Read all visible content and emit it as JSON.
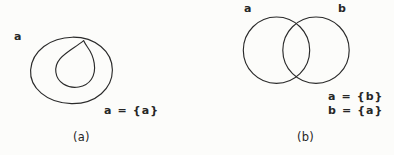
{
  "figure": {
    "background_color": "#fcfcfa",
    "ink_color": "#2a2a2a",
    "panels": [
      {
        "id": "a",
        "caption": "(a)",
        "set_labels": [
          {
            "name": "outer-set",
            "text": "a"
          }
        ],
        "equations": [
          {
            "name": "self-membership",
            "text": "a = {a}"
          }
        ],
        "shapes": "large oval containing a smaller teardrop circle tangent to the top of the oval"
      },
      {
        "id": "b",
        "caption": "(b)",
        "set_labels": [
          {
            "name": "left-set",
            "text": "a"
          },
          {
            "name": "right-set",
            "text": "b"
          }
        ],
        "equations": [
          {
            "name": "a-equals-b",
            "text": "a = {b}"
          },
          {
            "name": "b-equals-a",
            "text": "b = {a}"
          }
        ],
        "shapes": "two equal overlapping circles forming a vesica intersection"
      }
    ]
  }
}
